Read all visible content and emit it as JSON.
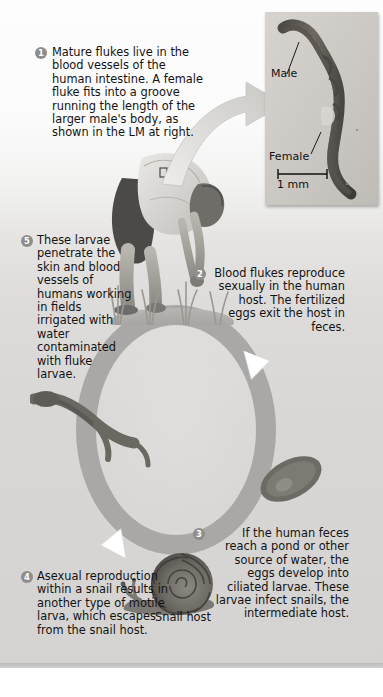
{
  "figure": {
    "accent_gray": "#a9a8a6",
    "badge_gray": "#8e8d8b",
    "panel_bg": "#dddcda"
  },
  "steps": [
    {
      "number": "1",
      "text": "Mature flukes live in the blood vessels of the human intestine. A female fluke fits into a groove running the length of the larger male's body, as shown in the LM at right."
    },
    {
      "number": "2",
      "text": "Blood flukes reproduce sexually in the human host. The fertilized eggs exit the host in feces."
    },
    {
      "number": "3",
      "text": "If the human feces reach a pond or other source of water, the eggs develop into ciliated larvae. These larvae infect snails, the intermediate host."
    },
    {
      "number": "4",
      "text": "Asexual reproduction within a snail results in another type of motile larva, which escapes from the snail host."
    },
    {
      "number": "5",
      "text": "These larvae penetrate the skin and blood vessels of humans working in fields irrigated with water contaminated with fluke larvae."
    }
  ],
  "micrograph": {
    "label_male": "Male",
    "label_female": "Female",
    "scale_bar": "1 mm"
  },
  "labels": {
    "snail_host": "Snail host"
  }
}
